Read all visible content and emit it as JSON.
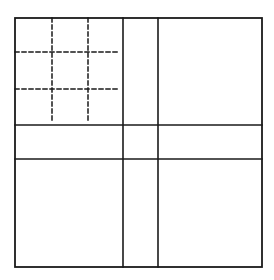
{
  "diagram": {
    "width": 274,
    "height": 280,
    "background": "#ffffff",
    "stroke_color": "#1a1a1a",
    "outer_square": {
      "x1": 15,
      "y1": 18,
      "x2": 262,
      "y2": 267
    },
    "solid_vertical_lines_x": [
      123,
      158
    ],
    "solid_horizontal_lines_y": [
      125,
      159
    ],
    "dashed_subgrid": {
      "region": {
        "x1": 15,
        "y1": 18,
        "x2": 120,
        "y2": 122
      },
      "vertical_lines_x": [
        52,
        88
      ],
      "horizontal_lines_y": [
        52,
        89
      ],
      "dash": "4,3"
    }
  }
}
